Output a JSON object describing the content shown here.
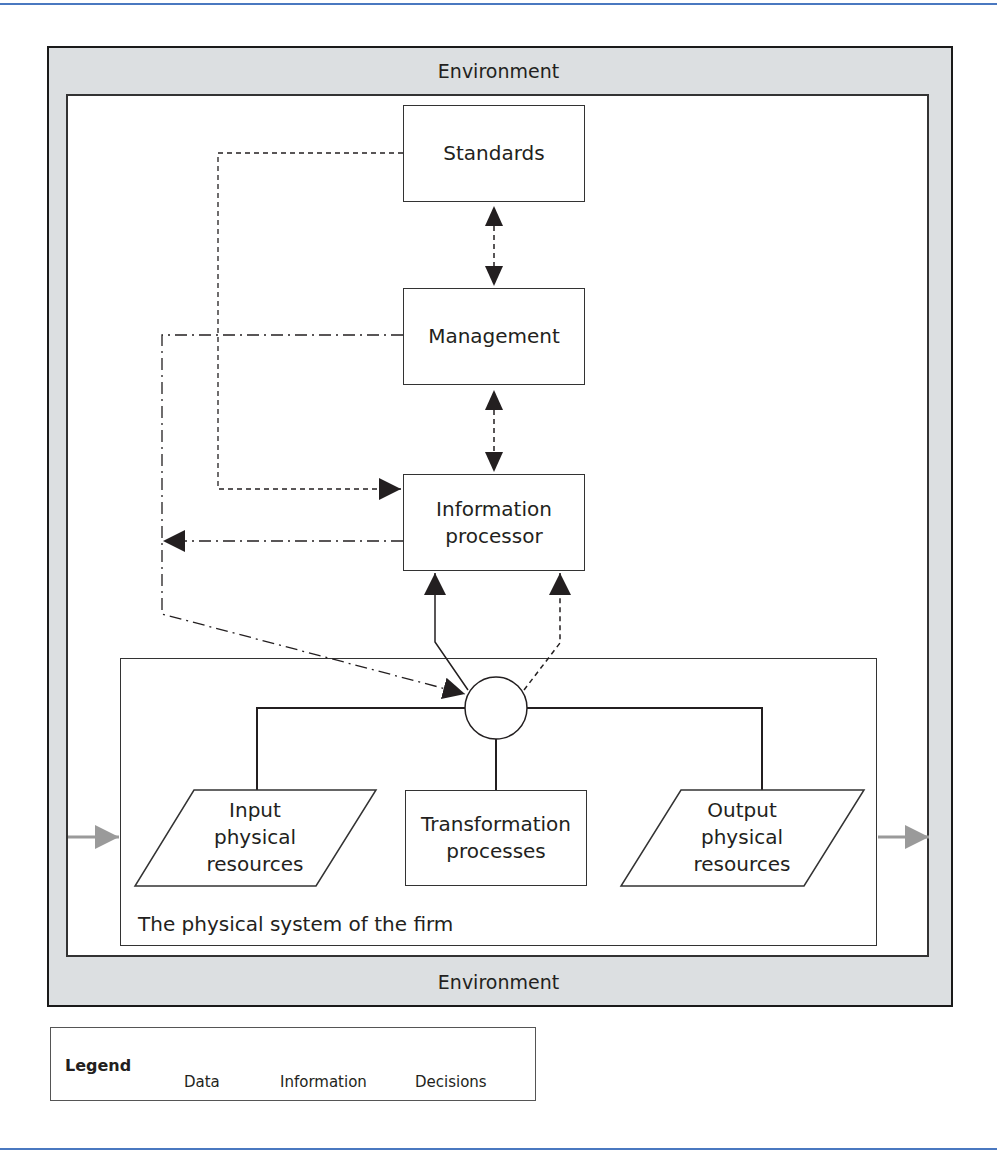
{
  "diagram": {
    "environment_top_label": "Environment",
    "environment_bottom_label": "Environment",
    "nodes": {
      "standards": "Standards",
      "management": "Management",
      "information_processor_line1": "Information",
      "information_processor_line2": "processor",
      "input_line1": "Input",
      "input_line2": "physical",
      "input_line3": "resources",
      "transformation_line1": "Transformation",
      "transformation_line2": "processes",
      "output_line1": "Output",
      "output_line2": "physical",
      "output_line3": "resources"
    },
    "physical_system_label": "The physical system of the firm",
    "connections": [
      {
        "from": "Standards",
        "to": "Management",
        "type": "information",
        "bidirectional": true
      },
      {
        "from": "Management",
        "to": "Information processor",
        "type": "information",
        "bidirectional": true
      },
      {
        "from": "Standards",
        "to": "Information processor",
        "type": "information"
      },
      {
        "from": "Management",
        "to": "Physical system",
        "type": "decisions"
      },
      {
        "from": "Information processor",
        "to": "Physical system",
        "type": "decisions"
      },
      {
        "from": "Physical system",
        "to": "Information processor",
        "type": "data"
      },
      {
        "from": "Physical system",
        "to": "Information processor",
        "type": "information"
      },
      {
        "from": "Environment",
        "to": "Physical system",
        "type": "physical flow"
      },
      {
        "from": "Physical system",
        "to": "Environment",
        "type": "physical flow"
      }
    ],
    "colors": {
      "environment_fill": "#dcdfe1",
      "line": "#231f20",
      "physical_flow_arrow": "#9a9a9a",
      "rule": "#4a78c0"
    }
  },
  "legend": {
    "title": "Legend",
    "items": [
      {
        "label": "Data",
        "style": "solid"
      },
      {
        "label": "Information",
        "style": "dashed"
      },
      {
        "label": "Decisions",
        "style": "dash-dot"
      }
    ]
  }
}
